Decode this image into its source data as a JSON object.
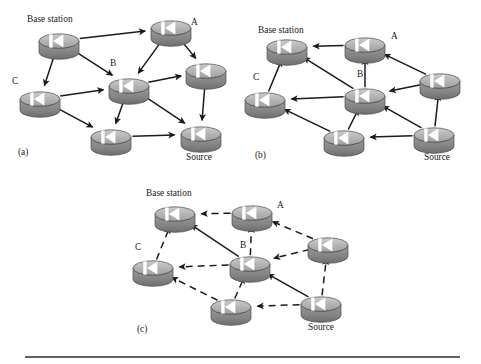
{
  "figure": {
    "background_color": "#ffffff",
    "width": 481,
    "height": 364,
    "node_icon_name": "router-node-icon",
    "node_glyph": "◀",
    "colors": {
      "node_top": "#b3b3b3",
      "node_top_highlight": "#cfcfcf",
      "node_side": "#8c8c8c",
      "node_side_dark": "#6f6f6f",
      "node_outline": "#4a4a4a",
      "glyph": "#ffffff",
      "arrow": "#1a1a1a",
      "text": "#1a1a1a",
      "rule": "#2b2b2b"
    },
    "rule": {
      "name": "bottom-divider",
      "x1": 25,
      "y1": 357,
      "x2": 460,
      "y2": 357,
      "thickness": 1.6
    }
  },
  "panels": [
    {
      "id": "a",
      "tag": "(a)",
      "tag_pos": {
        "x": 18,
        "y": 155
      },
      "caption_note": "Interest flooding from base station outward",
      "labels": [
        {
          "name": "label-base-station",
          "text": "Base station",
          "x": 27,
          "y": 22,
          "anchor": "start"
        },
        {
          "name": "label-a",
          "text": "A",
          "x": 191,
          "y": 25,
          "anchor": "start"
        },
        {
          "name": "label-b",
          "text": "B",
          "x": 110,
          "y": 66,
          "anchor": "start"
        },
        {
          "name": "label-c",
          "text": "C",
          "x": 12,
          "y": 84,
          "anchor": "start"
        },
        {
          "name": "label-source",
          "text": "Source",
          "x": 186,
          "y": 160,
          "anchor": "start"
        }
      ],
      "nodes": [
        {
          "name": "node-base-station",
          "id": "bs",
          "x": 59,
          "y": 41,
          "rx": 20,
          "ry": 7.2
        },
        {
          "name": "node-a",
          "id": "a",
          "x": 171,
          "y": 28,
          "rx": 20,
          "ry": 7.2
        },
        {
          "name": "node-right",
          "id": "r",
          "x": 206,
          "y": 71,
          "rx": 20,
          "ry": 7.2
        },
        {
          "name": "node-b",
          "id": "b",
          "x": 129,
          "y": 86,
          "rx": 20,
          "ry": 7.2
        },
        {
          "name": "node-c",
          "id": "c",
          "x": 40,
          "y": 99,
          "rx": 20,
          "ry": 7.2
        },
        {
          "name": "node-lower",
          "id": "l",
          "x": 111,
          "y": 137,
          "rx": 20,
          "ry": 7.2
        },
        {
          "name": "node-source",
          "id": "s",
          "x": 201,
          "y": 134,
          "rx": 20,
          "ry": 7.2
        }
      ],
      "edges": [
        {
          "name": "edge-bs-a",
          "from": "bs",
          "to": "a",
          "style": "solid"
        },
        {
          "name": "edge-bs-b",
          "from": "bs",
          "to": "b",
          "style": "solid"
        },
        {
          "name": "edge-bs-c",
          "from": "bs",
          "to": "c",
          "style": "solid"
        },
        {
          "name": "edge-a-r",
          "from": "a",
          "to": "r",
          "style": "solid"
        },
        {
          "name": "edge-a-b",
          "from": "a",
          "to": "b",
          "style": "solid"
        },
        {
          "name": "edge-c-b",
          "from": "c",
          "to": "b",
          "style": "solid"
        },
        {
          "name": "edge-c-l",
          "from": "c",
          "to": "l",
          "style": "solid"
        },
        {
          "name": "edge-b-r",
          "from": "b",
          "to": "r",
          "style": "solid"
        },
        {
          "name": "edge-b-l",
          "from": "b",
          "to": "l",
          "style": "solid"
        },
        {
          "name": "edge-b-s",
          "from": "b",
          "to": "s",
          "style": "solid"
        },
        {
          "name": "edge-r-s",
          "from": "r",
          "to": "s",
          "style": "solid"
        },
        {
          "name": "edge-l-s",
          "from": "l",
          "to": "s",
          "style": "solid"
        }
      ]
    },
    {
      "id": "b",
      "tag": "(b)",
      "tag_pos": {
        "x": 255,
        "y": 158
      },
      "caption_note": "Gradients set up back toward the base station",
      "labels": [
        {
          "name": "label-base-station",
          "text": "Base station",
          "x": 258,
          "y": 33,
          "anchor": "start"
        },
        {
          "name": "label-a",
          "text": "A",
          "x": 391,
          "y": 39,
          "anchor": "start"
        },
        {
          "name": "label-b",
          "text": "B",
          "x": 357,
          "y": 77,
          "anchor": "start"
        },
        {
          "name": "label-c",
          "text": "C",
          "x": 253,
          "y": 80,
          "anchor": "start"
        },
        {
          "name": "label-source",
          "text": "Source",
          "x": 424,
          "y": 160,
          "anchor": "start"
        }
      ],
      "nodes": [
        {
          "name": "node-base-station",
          "id": "bs",
          "x": 287,
          "y": 47,
          "rx": 20,
          "ry": 7.2
        },
        {
          "name": "node-a",
          "id": "a",
          "x": 365,
          "y": 45,
          "rx": 20,
          "ry": 7.2
        },
        {
          "name": "node-right",
          "id": "r",
          "x": 440,
          "y": 81,
          "rx": 20,
          "ry": 7.2
        },
        {
          "name": "node-b",
          "id": "b",
          "x": 365,
          "y": 96,
          "rx": 20,
          "ry": 7.2
        },
        {
          "name": "node-c",
          "id": "c",
          "x": 265,
          "y": 100,
          "rx": 20,
          "ry": 7.2
        },
        {
          "name": "node-lower",
          "id": "l",
          "x": 344,
          "y": 138,
          "rx": 20,
          "ry": 7.2
        },
        {
          "name": "node-source",
          "id": "s",
          "x": 434,
          "y": 135,
          "rx": 20,
          "ry": 7.2
        }
      ],
      "edges": [
        {
          "name": "edge-a-bs",
          "from": "a",
          "to": "bs",
          "style": "solid"
        },
        {
          "name": "edge-b-bs",
          "from": "b",
          "to": "bs",
          "style": "solid"
        },
        {
          "name": "edge-c-bs",
          "from": "c",
          "to": "bs",
          "style": "solid"
        },
        {
          "name": "edge-r-a",
          "from": "r",
          "to": "a",
          "style": "solid"
        },
        {
          "name": "edge-b-a",
          "from": "b",
          "to": "a",
          "style": "solid"
        },
        {
          "name": "edge-b-c",
          "from": "b",
          "to": "c",
          "style": "solid"
        },
        {
          "name": "edge-l-c",
          "from": "l",
          "to": "c",
          "style": "solid"
        },
        {
          "name": "edge-r-b",
          "from": "r",
          "to": "b",
          "style": "solid"
        },
        {
          "name": "edge-l-b",
          "from": "l",
          "to": "b",
          "style": "solid"
        },
        {
          "name": "edge-s-b",
          "from": "s",
          "to": "b",
          "style": "solid"
        },
        {
          "name": "edge-s-r",
          "from": "s",
          "to": "r",
          "style": "solid"
        },
        {
          "name": "edge-s-l",
          "from": "s",
          "to": "l",
          "style": "solid"
        }
      ]
    },
    {
      "id": "c",
      "tag": "(c)",
      "tag_pos": {
        "x": 137,
        "y": 332
      },
      "caption_note": "Reinforced data path drawn solid, other gradients dashed",
      "labels": [
        {
          "name": "label-base-station",
          "text": "Base station",
          "x": 146,
          "y": 196,
          "anchor": "start"
        },
        {
          "name": "label-a",
          "text": "A",
          "x": 277,
          "y": 208,
          "anchor": "start"
        },
        {
          "name": "label-b",
          "text": "B",
          "x": 240,
          "y": 248,
          "anchor": "start"
        },
        {
          "name": "label-c",
          "text": "C",
          "x": 135,
          "y": 250,
          "anchor": "start"
        },
        {
          "name": "label-source",
          "text": "Source",
          "x": 308,
          "y": 330,
          "anchor": "start"
        }
      ],
      "nodes": [
        {
          "name": "node-base-station",
          "id": "bs",
          "x": 175,
          "y": 214,
          "rx": 20,
          "ry": 7.2
        },
        {
          "name": "node-a",
          "id": "a",
          "x": 252,
          "y": 213,
          "rx": 20,
          "ry": 7.2
        },
        {
          "name": "node-right",
          "id": "r",
          "x": 328,
          "y": 245,
          "rx": 20,
          "ry": 7.2
        },
        {
          "name": "node-b",
          "id": "b",
          "x": 250,
          "y": 264,
          "rx": 20,
          "ry": 7.2
        },
        {
          "name": "node-c",
          "id": "c",
          "x": 153,
          "y": 268,
          "rx": 20,
          "ry": 7.2
        },
        {
          "name": "node-lower",
          "id": "l",
          "x": 231,
          "y": 307,
          "rx": 20,
          "ry": 7.2
        },
        {
          "name": "node-source",
          "id": "s",
          "x": 321,
          "y": 304,
          "rx": 20,
          "ry": 7.2
        }
      ],
      "edges": [
        {
          "name": "edge-a-bs",
          "from": "a",
          "to": "bs",
          "style": "dashed"
        },
        {
          "name": "edge-b-bs",
          "from": "b",
          "to": "bs",
          "style": "solid"
        },
        {
          "name": "edge-c-bs",
          "from": "c",
          "to": "bs",
          "style": "dashed"
        },
        {
          "name": "edge-r-a",
          "from": "r",
          "to": "a",
          "style": "dashed"
        },
        {
          "name": "edge-b-a",
          "from": "b",
          "to": "a",
          "style": "dashed"
        },
        {
          "name": "edge-b-c",
          "from": "b",
          "to": "c",
          "style": "dashed"
        },
        {
          "name": "edge-l-c",
          "from": "l",
          "to": "c",
          "style": "dashed"
        },
        {
          "name": "edge-r-b",
          "from": "r",
          "to": "b",
          "style": "dashed"
        },
        {
          "name": "edge-l-b",
          "from": "l",
          "to": "b",
          "style": "dashed"
        },
        {
          "name": "edge-s-b",
          "from": "s",
          "to": "b",
          "style": "solid"
        },
        {
          "name": "edge-s-r",
          "from": "s",
          "to": "r",
          "style": "dashed"
        },
        {
          "name": "edge-s-l",
          "from": "s",
          "to": "l",
          "style": "dashed"
        }
      ]
    }
  ]
}
